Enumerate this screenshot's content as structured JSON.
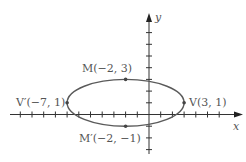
{
  "diagram": {
    "type": "ellipse-on-coordinate-plane",
    "colors": {
      "axis": "#333333",
      "curve": "#5a5a5a",
      "point": "#444444",
      "text": "#555555"
    },
    "axes": {
      "x_label": "x",
      "y_label": "y",
      "x_range": [
        -12,
        7
      ],
      "y_range": [
        -3,
        8
      ],
      "tick_step": 1
    },
    "ellipse": {
      "center": [
        -2,
        1
      ],
      "semi_major": 5,
      "semi_minor": 2,
      "orientation": "horizontal"
    },
    "points": [
      {
        "id": "M",
        "label": "M(−2, 3)",
        "x": -2,
        "y": 3
      },
      {
        "id": "M_prime",
        "label": "M′(−2, −1)",
        "x": -2,
        "y": -1
      },
      {
        "id": "V_prime",
        "label": "V′(−7, 1)",
        "x": -7,
        "y": 1
      },
      {
        "id": "V",
        "label": "V(3, 1)",
        "x": 3,
        "y": 1
      }
    ]
  }
}
